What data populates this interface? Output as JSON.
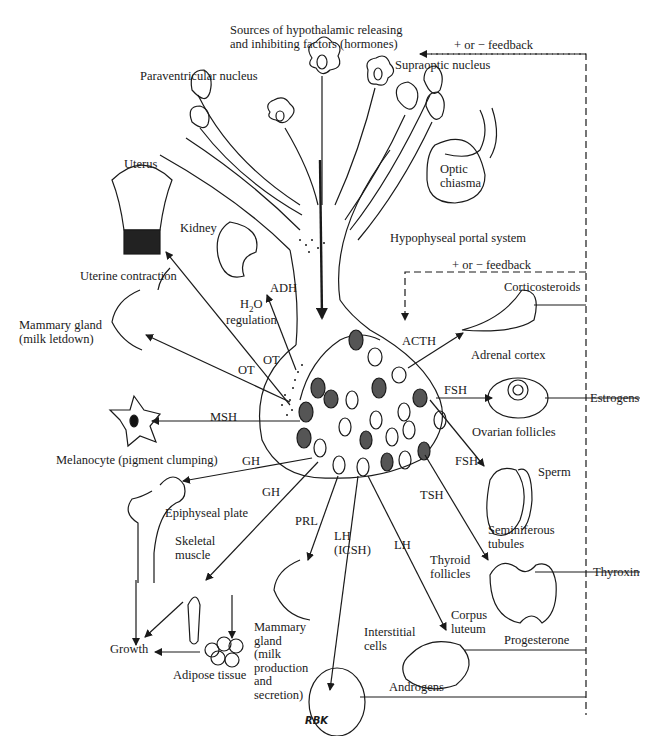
{
  "diagram": {
    "title_lines": [
      "Sources of hypothalamic releasing",
      "and inhibiting factors (hormones)"
    ],
    "feedback_top": "+ or − feedback",
    "feedback_mid": "+ or − feedback",
    "hypothalamus": {
      "paraventricular": "Paraventricular nucleus",
      "supraoptic": "Supraoptic nucleus",
      "optic_chiasma": "Optic\nchiasma",
      "portal_system": "Hypophyseal portal system"
    },
    "posterior_pituitary_targets": {
      "uterus": "Uterus",
      "uterine_contraction": "Uterine contraction",
      "kidney": "Kidney",
      "adh": "ADH",
      "h2o_regulation_1": "H",
      "h2o_regulation_sub": "2",
      "h2o_regulation_2": "O",
      "regulation": "regulation",
      "mammary_letdown": "Mammary gland\n(milk letdown)",
      "ot_1": "OT",
      "ot_2": "OT"
    },
    "anterior_pituitary_targets": {
      "msh": "MSH",
      "melanocyte": "Melanocyte (pigment clumping)",
      "gh_1": "GH",
      "gh_2": "GH",
      "epiphyseal_plate": "Epiphyseal plate",
      "skeletal_muscle": "Skeletal\nmuscle",
      "growth": "Growth",
      "adipose_tissue": "Adipose tissue",
      "prl": "PRL",
      "mammary_production": "Mammary\ngland\n(milk\nproduction\nand\nsecretion)",
      "lh_icsh": "LH\n(ICSH)",
      "interstitial_cells": "Interstitial\ncells",
      "androgens": "Androgens",
      "lh": "LH",
      "corpus_luteum": "Corpus\nluteum",
      "progesterone": "Progesterone",
      "tsh": "TSH",
      "thyroid_follicles": "Thyroid\nfollicles",
      "thyroxin": "Thyroxin",
      "fsh_1": "FSH",
      "fsh_2": "FSH",
      "ovarian_follicles": "Ovarian follicles",
      "estrogens": "Estrogens",
      "sperm": "Sperm",
      "seminiferous_tubules": "Seminiferous\ntubules",
      "acth": "ACTH",
      "adrenal_cortex": "Adrenal cortex",
      "corticosteroids": "Corticosteroids"
    },
    "signature": "RBK",
    "colors": {
      "ink": "#1a1a1a",
      "cell_dark": "#555555",
      "background": "#ffffff"
    }
  }
}
